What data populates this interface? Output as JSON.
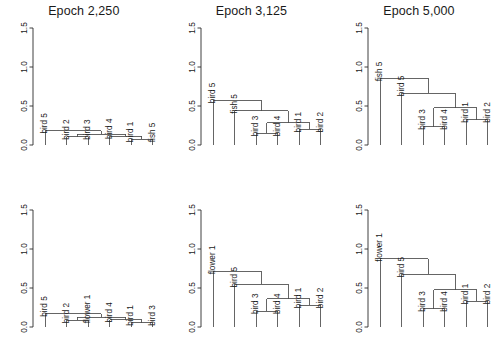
{
  "figure": {
    "width": 503,
    "height": 364,
    "background": "#ffffff",
    "line_color": "#4a4a4a",
    "axis_color": "#2b2b2b",
    "text_color": "#1a1a1a"
  },
  "axis": {
    "ticks": [
      "0.0",
      "0.5",
      "1.0",
      "1.5"
    ],
    "tick_values": [
      0.0,
      0.5,
      1.0,
      1.5
    ],
    "ylim": [
      0,
      1.5
    ],
    "label": ""
  },
  "panels": [
    {
      "id": "panel-top-left",
      "title": "Epoch 2,250",
      "row": 0,
      "col": 0
    },
    {
      "id": "panel-top-mid",
      "title": "Epoch 3,125",
      "row": 0,
      "col": 1
    },
    {
      "id": "panel-top-right",
      "title": "Epoch 5,000",
      "row": 0,
      "col": 2
    },
    {
      "id": "panel-bottom-left",
      "title": "",
      "row": 1,
      "col": 0
    },
    {
      "id": "panel-bottom-mid",
      "title": "",
      "row": 1,
      "col": 1
    },
    {
      "id": "panel-bottom-right",
      "title": "",
      "row": 1,
      "col": 2
    }
  ],
  "chart_data": [
    {
      "type": "dendrogram",
      "panel": "panel-top-left",
      "title": "Epoch 2,250",
      "xlabel": "",
      "ylabel": "",
      "ylim": [
        0,
        1.5
      ],
      "yticks": [
        0.0,
        0.5,
        1.0,
        1.5
      ],
      "grid": false,
      "leaves": [
        "bird 5",
        "bird 2",
        "bird 3",
        "bird 4",
        "bird 1",
        "fish 5"
      ],
      "merges": [
        {
          "left": "bird 2",
          "right": "bird 3",
          "height": 0.105
        },
        {
          "left": "bird 1",
          "right": "fish 5",
          "height": 0.075
        },
        {
          "left": "bird 4",
          "right": "(bird 1, fish 5)",
          "height": 0.115
        },
        {
          "left": "(bird 2, bird 3)",
          "right": "(bird 4, bird 1, fish 5)",
          "height": 0.14
        },
        {
          "left": "bird 5",
          "right": "(bird 2, bird 3, bird 4, bird 1, fish 5)",
          "height": 0.185
        }
      ]
    },
    {
      "type": "dendrogram",
      "panel": "panel-top-mid",
      "title": "Epoch 3,125",
      "xlabel": "",
      "ylabel": "",
      "ylim": [
        0,
        1.5
      ],
      "yticks": [
        0.0,
        0.5,
        1.0,
        1.5
      ],
      "grid": false,
      "leaves": [
        "bird 5",
        "fish 5",
        "bird 3",
        "bird 4",
        "bird 1",
        "bird 2"
      ],
      "merges": [
        {
          "left": "bird 3",
          "right": "bird 4",
          "height": 0.15
        },
        {
          "left": "bird 1",
          "right": "bird 2",
          "height": 0.2
        },
        {
          "left": "(bird 3, bird 4)",
          "right": "(bird 1, bird 2)",
          "height": 0.285
        },
        {
          "left": "fish 5",
          "right": "(bird 3, bird 4, bird 1, bird 2)",
          "height": 0.44
        },
        {
          "left": "bird 5",
          "right": "(fish 5, bird 3, bird 4, bird 1, bird 2)",
          "height": 0.575
        }
      ]
    },
    {
      "type": "dendrogram",
      "panel": "panel-top-right",
      "title": "Epoch 5,000",
      "xlabel": "",
      "ylabel": "",
      "ylim": [
        0,
        1.5
      ],
      "yticks": [
        0.0,
        0.5,
        1.0,
        1.5
      ],
      "grid": false,
      "leaves": [
        "fish 5",
        "bird 5",
        "bird 3",
        "bird 4",
        "bird 1",
        "bird 2"
      ],
      "merges": [
        {
          "left": "bird 3",
          "right": "bird 4",
          "height": 0.235
        },
        {
          "left": "bird 1",
          "right": "bird 2",
          "height": 0.325
        },
        {
          "left": "(bird 3, bird 4)",
          "right": "(bird 1, bird 2)",
          "height": 0.475
        },
        {
          "left": "bird 5",
          "right": "(bird 3, bird 4, bird 1, bird 2)",
          "height": 0.665
        },
        {
          "left": "fish 5",
          "right": "(bird 5, bird 3, bird 4, bird 1, bird 2)",
          "height": 0.855
        }
      ]
    },
    {
      "type": "dendrogram",
      "panel": "panel-bottom-left",
      "title": "",
      "xlabel": "",
      "ylabel": "",
      "ylim": [
        0,
        1.5
      ],
      "yticks": [
        0.0,
        0.5,
        1.0,
        1.5
      ],
      "grid": false,
      "leaves": [
        "bird 5",
        "bird 2",
        "flower 1",
        "bird 4",
        "bird 1",
        "bird 3"
      ],
      "merges": [
        {
          "left": "bird 2",
          "right": "flower 1",
          "height": 0.085
        },
        {
          "left": "bird 1",
          "right": "bird 3",
          "height": 0.055
        },
        {
          "left": "bird 4",
          "right": "(bird 1, bird 3)",
          "height": 0.095
        },
        {
          "left": "(bird 2, flower 1)",
          "right": "(bird 4, bird 1, bird 3)",
          "height": 0.125
        },
        {
          "left": "bird 5",
          "right": "(bird 2, flower 1, bird 4, bird 1, bird 3)",
          "height": 0.17
        }
      ]
    },
    {
      "type": "dendrogram",
      "panel": "panel-bottom-mid",
      "title": "",
      "xlabel": "",
      "ylabel": "",
      "ylim": [
        0,
        1.5
      ],
      "yticks": [
        0.0,
        0.5,
        1.0,
        1.5
      ],
      "grid": false,
      "leaves": [
        "flower 1",
        "bird 5",
        "bird 3",
        "bird 4",
        "bird 1",
        "bird 2"
      ],
      "merges": [
        {
          "left": "bird 3",
          "right": "bird 4",
          "height": 0.205
        },
        {
          "left": "bird 1",
          "right": "bird 2",
          "height": 0.28
        },
        {
          "left": "(bird 3, bird 4)",
          "right": "(bird 1, bird 2)",
          "height": 0.36
        },
        {
          "left": "bird 5",
          "right": "(bird 3, bird 4, bird 1, bird 2)",
          "height": 0.545
        },
        {
          "left": "flower 1",
          "right": "(bird 5, bird 3, bird 4, bird 1, bird 2)",
          "height": 0.715
        }
      ]
    },
    {
      "type": "dendrogram",
      "panel": "panel-bottom-right",
      "title": "",
      "xlabel": "",
      "ylabel": "",
      "ylim": [
        0,
        1.5
      ],
      "yticks": [
        0.0,
        0.5,
        1.0,
        1.5
      ],
      "grid": false,
      "leaves": [
        "flower 1",
        "bird 5",
        "bird 3",
        "bird 4",
        "bird 1",
        "bird 2"
      ],
      "merges": [
        {
          "left": "bird 3",
          "right": "bird 4",
          "height": 0.235
        },
        {
          "left": "bird 1",
          "right": "bird 2",
          "height": 0.33
        },
        {
          "left": "(bird 3, bird 4)",
          "right": "(bird 1, bird 2)",
          "height": 0.48
        },
        {
          "left": "bird 5",
          "right": "(bird 3, bird 4, bird 1, bird 2)",
          "height": 0.675
        },
        {
          "left": "flower 1",
          "right": "(bird 5, bird 3, bird 4, bird 1, bird 2)",
          "height": 0.875
        }
      ]
    }
  ]
}
